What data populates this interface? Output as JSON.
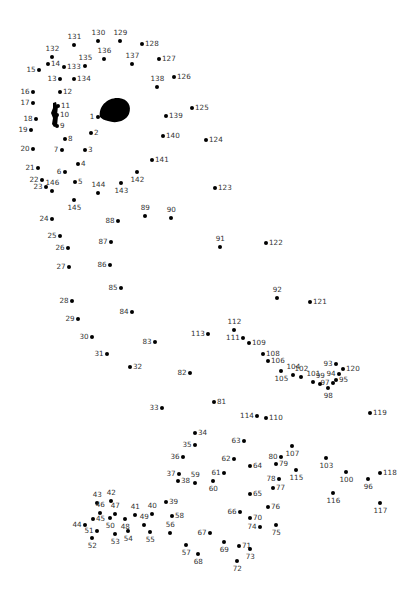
{
  "puzzle": {
    "type": "connect-the-dots",
    "dot_color": "#000000",
    "label_color": "#333333",
    "background": "#ffffff",
    "points": [
      {
        "n": 1,
        "x": 98,
        "y": 117,
        "lx": -8,
        "ly": -4,
        "pos": "left"
      },
      {
        "n": 2,
        "x": 91,
        "y": 133,
        "pos": "right"
      },
      {
        "n": 3,
        "x": 85,
        "y": 150,
        "pos": "right"
      },
      {
        "n": 4,
        "x": 78,
        "y": 164,
        "pos": "right"
      },
      {
        "n": 5,
        "x": 75,
        "y": 182,
        "pos": "right"
      },
      {
        "n": 6,
        "x": 65,
        "y": 172,
        "pos": "left"
      },
      {
        "n": 7,
        "x": 62,
        "y": 150,
        "pos": "left"
      },
      {
        "n": 8,
        "x": 65,
        "y": 139,
        "pos": "right"
      },
      {
        "n": 9,
        "x": 57,
        "y": 126,
        "pos": "right"
      },
      {
        "n": 10,
        "x": 57,
        "y": 115,
        "pos": "right"
      },
      {
        "n": 11,
        "x": 58,
        "y": 106,
        "pos": "right"
      },
      {
        "n": 12,
        "x": 60,
        "y": 92,
        "pos": "right"
      },
      {
        "n": 13,
        "x": 60,
        "y": 79,
        "pos": "left"
      },
      {
        "n": 14,
        "x": 48,
        "y": 64,
        "pos": "right"
      },
      {
        "n": 15,
        "x": 39,
        "y": 70,
        "pos": "left"
      },
      {
        "n": 16,
        "x": 33,
        "y": 92,
        "pos": "left"
      },
      {
        "n": 17,
        "x": 33,
        "y": 103,
        "pos": "left"
      },
      {
        "n": 18,
        "x": 36,
        "y": 119,
        "pos": "left"
      },
      {
        "n": 19,
        "x": 31,
        "y": 130,
        "pos": "left"
      },
      {
        "n": 20,
        "x": 33,
        "y": 149,
        "pos": "left"
      },
      {
        "n": 21,
        "x": 38,
        "y": 168,
        "pos": "left"
      },
      {
        "n": 22,
        "x": 42,
        "y": 180,
        "pos": "left"
      },
      {
        "n": 23,
        "x": 46,
        "y": 187,
        "pos": "left"
      },
      {
        "n": 24,
        "x": 52,
        "y": 219,
        "pos": "left"
      },
      {
        "n": 25,
        "x": 60,
        "y": 236,
        "pos": "left"
      },
      {
        "n": 26,
        "x": 68,
        "y": 248,
        "pos": "left"
      },
      {
        "n": 27,
        "x": 69,
        "y": 267,
        "pos": "left"
      },
      {
        "n": 28,
        "x": 72,
        "y": 301,
        "pos": "left"
      },
      {
        "n": 29,
        "x": 78,
        "y": 319,
        "pos": "left"
      },
      {
        "n": 30,
        "x": 92,
        "y": 337,
        "pos": "left"
      },
      {
        "n": 31,
        "x": 107,
        "y": 354,
        "pos": "left"
      },
      {
        "n": 32,
        "x": 130,
        "y": 367,
        "pos": "right"
      },
      {
        "n": 33,
        "x": 162,
        "y": 408,
        "pos": "left"
      },
      {
        "n": 34,
        "x": 195,
        "y": 433,
        "pos": "right"
      },
      {
        "n": 35,
        "x": 195,
        "y": 445,
        "pos": "left"
      },
      {
        "n": 36,
        "x": 183,
        "y": 457,
        "pos": "left"
      },
      {
        "n": 37,
        "x": 179,
        "y": 474,
        "pos": "left"
      },
      {
        "n": 38,
        "x": 178,
        "y": 481,
        "pos": "right"
      },
      {
        "n": 39,
        "x": 166,
        "y": 502,
        "pos": "right"
      },
      {
        "n": 40,
        "x": 152,
        "y": 514,
        "pos": "above"
      },
      {
        "n": 41,
        "x": 135,
        "y": 515,
        "pos": "above"
      },
      {
        "n": 42,
        "x": 111,
        "y": 501,
        "pos": "above"
      },
      {
        "n": 43,
        "x": 97,
        "y": 503,
        "pos": "above"
      },
      {
        "n": 44,
        "x": 85,
        "y": 525,
        "pos": "left"
      },
      {
        "n": 45,
        "x": 93,
        "y": 519,
        "pos": "right"
      },
      {
        "n": 46,
        "x": 100,
        "y": 513,
        "pos": "above"
      },
      {
        "n": 47,
        "x": 115,
        "y": 514,
        "pos": "above"
      },
      {
        "n": 48,
        "x": 125,
        "y": 519,
        "pos": "below"
      },
      {
        "n": 49,
        "x": 144,
        "y": 525,
        "pos": "above"
      },
      {
        "n": 50,
        "x": 110,
        "y": 518,
        "pos": "below"
      },
      {
        "n": 51,
        "x": 97,
        "y": 531,
        "pos": "left"
      },
      {
        "n": 52,
        "x": 92,
        "y": 538,
        "pos": "below"
      },
      {
        "n": 53,
        "x": 115,
        "y": 534,
        "pos": "below"
      },
      {
        "n": 54,
        "x": 128,
        "y": 531,
        "pos": "below"
      },
      {
        "n": 55,
        "x": 150,
        "y": 532,
        "pos": "below"
      },
      {
        "n": 56,
        "x": 170,
        "y": 533,
        "pos": "above"
      },
      {
        "n": 57,
        "x": 186,
        "y": 545,
        "pos": "below"
      },
      {
        "n": 58,
        "x": 172,
        "y": 516,
        "pos": "right"
      },
      {
        "n": 59,
        "x": 195,
        "y": 483,
        "pos": "above"
      },
      {
        "n": 60,
        "x": 213,
        "y": 481,
        "pos": "below"
      },
      {
        "n": 61,
        "x": 224,
        "y": 473,
        "pos": "left"
      },
      {
        "n": 62,
        "x": 234,
        "y": 459,
        "pos": "left"
      },
      {
        "n": 63,
        "x": 244,
        "y": 441,
        "pos": "left"
      },
      {
        "n": 64,
        "x": 250,
        "y": 466,
        "pos": "right"
      },
      {
        "n": 65,
        "x": 250,
        "y": 494,
        "pos": "right"
      },
      {
        "n": 66,
        "x": 240,
        "y": 512,
        "pos": "left"
      },
      {
        "n": 67,
        "x": 210,
        "y": 533,
        "pos": "left"
      },
      {
        "n": 68,
        "x": 198,
        "y": 554,
        "pos": "below"
      },
      {
        "n": 69,
        "x": 224,
        "y": 542,
        "pos": "below"
      },
      {
        "n": 70,
        "x": 250,
        "y": 518,
        "pos": "right"
      },
      {
        "n": 71,
        "x": 239,
        "y": 546,
        "pos": "right"
      },
      {
        "n": 72,
        "x": 237,
        "y": 561,
        "pos": "below"
      },
      {
        "n": 73,
        "x": 250,
        "y": 549,
        "pos": "below"
      },
      {
        "n": 74,
        "x": 260,
        "y": 527,
        "pos": "left"
      },
      {
        "n": 75,
        "x": 276,
        "y": 525,
        "pos": "below"
      },
      {
        "n": 76,
        "x": 268,
        "y": 507,
        "pos": "right"
      },
      {
        "n": 77,
        "x": 273,
        "y": 488,
        "pos": "right"
      },
      {
        "n": 78,
        "x": 279,
        "y": 479,
        "pos": "left"
      },
      {
        "n": 79,
        "x": 276,
        "y": 464,
        "pos": "right"
      },
      {
        "n": 80,
        "x": 281,
        "y": 457,
        "pos": "left"
      },
      {
        "n": 81,
        "x": 214,
        "y": 402,
        "pos": "right"
      },
      {
        "n": 82,
        "x": 190,
        "y": 373,
        "pos": "left"
      },
      {
        "n": 83,
        "x": 155,
        "y": 342,
        "pos": "left"
      },
      {
        "n": 84,
        "x": 132,
        "y": 312,
        "pos": "left"
      },
      {
        "n": 85,
        "x": 121,
        "y": 288,
        "pos": "left"
      },
      {
        "n": 86,
        "x": 110,
        "y": 265,
        "pos": "left"
      },
      {
        "n": 87,
        "x": 111,
        "y": 242,
        "pos": "left"
      },
      {
        "n": 88,
        "x": 118,
        "y": 221,
        "pos": "left"
      },
      {
        "n": 89,
        "x": 145,
        "y": 216,
        "pos": "above"
      },
      {
        "n": 90,
        "x": 171,
        "y": 218,
        "pos": "above"
      },
      {
        "n": 91,
        "x": 220,
        "y": 247,
        "pos": "above"
      },
      {
        "n": 92,
        "x": 277,
        "y": 298,
        "pos": "above"
      },
      {
        "n": 93,
        "x": 336,
        "y": 364,
        "pos": "left"
      },
      {
        "n": 94,
        "x": 339,
        "y": 374,
        "pos": "left"
      },
      {
        "n": 95,
        "x": 336,
        "y": 380,
        "pos": "right"
      },
      {
        "n": 96,
        "x": 368,
        "y": 479,
        "pos": "below"
      },
      {
        "n": 97,
        "x": 333,
        "y": 383,
        "pos": "left"
      },
      {
        "n": 98,
        "x": 328,
        "y": 388,
        "pos": "below"
      },
      {
        "n": 99,
        "x": 320,
        "y": 384,
        "pos": "above"
      },
      {
        "n": 100,
        "x": 346,
        "y": 472,
        "pos": "below"
      },
      {
        "n": 101,
        "x": 313,
        "y": 382,
        "pos": "above"
      },
      {
        "n": 102,
        "x": 301,
        "y": 377,
        "pos": "above"
      },
      {
        "n": 103,
        "x": 326,
        "y": 458,
        "pos": "below"
      },
      {
        "n": 104,
        "x": 293,
        "y": 375,
        "pos": "above"
      },
      {
        "n": 105,
        "x": 281,
        "y": 371,
        "pos": "below"
      },
      {
        "n": 106,
        "x": 268,
        "y": 361,
        "pos": "right"
      },
      {
        "n": 107,
        "x": 292,
        "y": 446,
        "pos": "below"
      },
      {
        "n": 108,
        "x": 263,
        "y": 354,
        "pos": "right"
      },
      {
        "n": 109,
        "x": 249,
        "y": 343,
        "pos": "right"
      },
      {
        "n": 110,
        "x": 266,
        "y": 418,
        "pos": "right"
      },
      {
        "n": 111,
        "x": 243,
        "y": 338,
        "pos": "left"
      },
      {
        "n": 112,
        "x": 234,
        "y": 330,
        "pos": "above"
      },
      {
        "n": 113,
        "x": 208,
        "y": 334,
        "pos": "left"
      },
      {
        "n": 114,
        "x": 257,
        "y": 416,
        "pos": "left"
      },
      {
        "n": 115,
        "x": 296,
        "y": 470,
        "pos": "below"
      },
      {
        "n": 116,
        "x": 333,
        "y": 493,
        "pos": "below"
      },
      {
        "n": 117,
        "x": 380,
        "y": 503,
        "pos": "below"
      },
      {
        "n": 118,
        "x": 380,
        "y": 473,
        "pos": "right"
      },
      {
        "n": 119,
        "x": 370,
        "y": 413,
        "pos": "right"
      },
      {
        "n": 120,
        "x": 343,
        "y": 369,
        "pos": "right"
      },
      {
        "n": 121,
        "x": 310,
        "y": 302,
        "pos": "right"
      },
      {
        "n": 122,
        "x": 266,
        "y": 243,
        "pos": "right"
      },
      {
        "n": 123,
        "x": 215,
        "y": 188,
        "pos": "right"
      },
      {
        "n": 124,
        "x": 206,
        "y": 140,
        "pos": "right"
      },
      {
        "n": 125,
        "x": 192,
        "y": 108,
        "pos": "right"
      },
      {
        "n": 126,
        "x": 174,
        "y": 77,
        "pos": "right"
      },
      {
        "n": 127,
        "x": 159,
        "y": 59,
        "pos": "right"
      },
      {
        "n": 128,
        "x": 142,
        "y": 44,
        "pos": "right"
      },
      {
        "n": 129,
        "x": 120,
        "y": 41,
        "pos": "above"
      },
      {
        "n": 130,
        "x": 98,
        "y": 41,
        "pos": "above"
      },
      {
        "n": 131,
        "x": 74,
        "y": 45,
        "pos": "above"
      },
      {
        "n": 132,
        "x": 52,
        "y": 57,
        "pos": "above"
      },
      {
        "n": 133,
        "x": 64,
        "y": 67,
        "pos": "right"
      },
      {
        "n": 134,
        "x": 74,
        "y": 79,
        "pos": "right"
      },
      {
        "n": 135,
        "x": 85,
        "y": 66,
        "pos": "above"
      },
      {
        "n": 136,
        "x": 104,
        "y": 59,
        "pos": "above"
      },
      {
        "n": 137,
        "x": 132,
        "y": 64,
        "pos": "above"
      },
      {
        "n": 138,
        "x": 157,
        "y": 87,
        "pos": "above"
      },
      {
        "n": 139,
        "x": 166,
        "y": 116,
        "pos": "right"
      },
      {
        "n": 140,
        "x": 163,
        "y": 136,
        "pos": "right"
      },
      {
        "n": 141,
        "x": 152,
        "y": 160,
        "pos": "right"
      },
      {
        "n": 142,
        "x": 137,
        "y": 172,
        "pos": "below"
      },
      {
        "n": 143,
        "x": 121,
        "y": 183,
        "pos": "below"
      },
      {
        "n": 144,
        "x": 98,
        "y": 193,
        "pos": "above"
      },
      {
        "n": 145,
        "x": 74,
        "y": 200,
        "pos": "below"
      },
      {
        "n": 146,
        "x": 52,
        "y": 191,
        "pos": "above"
      }
    ],
    "eye": {
      "cx": 115,
      "cy": 110,
      "shape": "teardrop"
    },
    "nostril": {
      "x": 54,
      "y": 104,
      "shape": "bracket"
    }
  }
}
